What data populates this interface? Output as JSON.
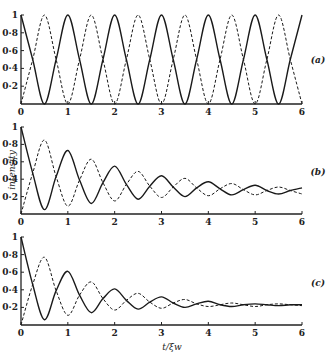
{
  "figure": {
    "ylabel": "intensity",
    "xlabel": "t/ξw",
    "colors": {
      "line": "#1a1a1a",
      "axis": "#222222",
      "background": "#ffffff"
    }
  },
  "chart_data": [
    {
      "type": "line",
      "panel_label": "(a)",
      "title": "",
      "xlabel": "",
      "ylabel": "",
      "xlim": [
        0,
        6
      ],
      "ylim": [
        0,
        1
      ],
      "xticks": [
        "0",
        "1",
        "2",
        "3",
        "4",
        "5",
        "6"
      ],
      "yticks": [
        "0.2",
        "0.4",
        "0.6",
        "0.8",
        "1"
      ],
      "grid": false,
      "legend": "none",
      "x": [
        0,
        0.25,
        0.5,
        0.75,
        1,
        1.25,
        1.5,
        1.75,
        2,
        2.25,
        2.5,
        2.75,
        3,
        3.25,
        3.5,
        3.75,
        4,
        4.25,
        4.5,
        4.75,
        5,
        5.25,
        5.5,
        5.75,
        6
      ],
      "series": [
        {
          "name": "solid",
          "style": "solid",
          "values": [
            1,
            0.5,
            0,
            0.5,
            1,
            0.5,
            0,
            0.5,
            1,
            0.5,
            0,
            0.5,
            1,
            0.5,
            0,
            0.5,
            1,
            0.5,
            0,
            0.5,
            1,
            0.5,
            0,
            0.5,
            1
          ]
        },
        {
          "name": "dashed",
          "style": "dashed",
          "values": [
            0,
            0.5,
            1,
            0.5,
            0,
            0.5,
            1,
            0.5,
            0,
            0.5,
            1,
            0.5,
            0,
            0.5,
            1,
            0.5,
            0,
            0.5,
            1,
            0.5,
            0,
            0.5,
            1,
            0.5,
            0
          ]
        }
      ]
    },
    {
      "type": "line",
      "panel_label": "(b)",
      "title": "",
      "xlabel": "",
      "ylabel": "intensity",
      "xlim": [
        0,
        6
      ],
      "ylim": [
        0,
        1
      ],
      "xticks": [
        "0",
        "1",
        "2",
        "3",
        "4",
        "5",
        "6"
      ],
      "yticks": [
        "0.2",
        "0.4",
        "0.6",
        "0.8",
        "1"
      ],
      "grid": false,
      "legend": "none",
      "x": [
        0,
        0.25,
        0.5,
        0.75,
        1,
        1.25,
        1.5,
        1.75,
        2,
        2.25,
        2.5,
        2.75,
        3,
        3.25,
        3.5,
        3.75,
        4,
        4.25,
        4.5,
        4.75,
        5,
        5.25,
        5.5,
        5.75,
        6
      ],
      "series": [
        {
          "name": "solid",
          "style": "solid",
          "values": [
            1,
            0.47,
            0.05,
            0.43,
            0.73,
            0.39,
            0.12,
            0.36,
            0.55,
            0.34,
            0.17,
            0.32,
            0.44,
            0.31,
            0.2,
            0.3,
            0.37,
            0.29,
            0.22,
            0.28,
            0.33,
            0.27,
            0.23,
            0.27,
            0.3
          ]
        },
        {
          "name": "dashed",
          "style": "dashed",
          "values": [
            0,
            0.47,
            0.85,
            0.43,
            0.09,
            0.39,
            0.63,
            0.36,
            0.15,
            0.34,
            0.49,
            0.32,
            0.19,
            0.31,
            0.41,
            0.3,
            0.21,
            0.29,
            0.35,
            0.28,
            0.22,
            0.27,
            0.31,
            0.27,
            0.23
          ]
        }
      ]
    },
    {
      "type": "line",
      "panel_label": "(c)",
      "title": "",
      "xlabel": "t/ξw",
      "ylabel": "",
      "xlim": [
        0,
        6
      ],
      "ylim": [
        0,
        1
      ],
      "xticks": [
        "0",
        "1",
        "2",
        "3",
        "4",
        "5",
        "6"
      ],
      "yticks": [
        "0.2",
        "0.4",
        "0.6",
        "0.8",
        "1"
      ],
      "grid": false,
      "legend": "none",
      "x": [
        0,
        0.25,
        0.5,
        0.75,
        1,
        1.25,
        1.5,
        1.75,
        2,
        2.25,
        2.5,
        2.75,
        3,
        3.25,
        3.5,
        3.75,
        4,
        4.25,
        4.5,
        4.75,
        5,
        5.25,
        5.5,
        5.75,
        6
      ],
      "series": [
        {
          "name": "solid",
          "style": "solid",
          "values": [
            1,
            0.46,
            0.06,
            0.39,
            0.61,
            0.34,
            0.14,
            0.3,
            0.41,
            0.28,
            0.18,
            0.26,
            0.32,
            0.25,
            0.2,
            0.24,
            0.27,
            0.23,
            0.21,
            0.23,
            0.24,
            0.23,
            0.22,
            0.23,
            0.23
          ]
        },
        {
          "name": "dashed",
          "style": "dashed",
          "values": [
            0,
            0.46,
            0.77,
            0.39,
            0.11,
            0.34,
            0.49,
            0.3,
            0.17,
            0.28,
            0.36,
            0.26,
            0.19,
            0.25,
            0.29,
            0.24,
            0.21,
            0.23,
            0.25,
            0.23,
            0.21,
            0.23,
            0.24,
            0.23,
            0.22
          ]
        }
      ]
    }
  ],
  "layout": {
    "panels": [
      {
        "x0": 21,
        "x1": 302,
        "y0": 104,
        "y1": 15,
        "label_x": 318,
        "label_y": 63
      },
      {
        "x0": 21,
        "x1": 302,
        "y0": 214,
        "y1": 127,
        "label_x": 318,
        "label_y": 175
      },
      {
        "x0": 21,
        "x1": 302,
        "y0": 325,
        "y1": 237,
        "label_x": 318,
        "label_y": 286
      }
    ],
    "ylabel_pos": {
      "x": 15,
      "y": 170
    },
    "xlabel_pos": {
      "x": 172,
      "y": 350
    }
  }
}
